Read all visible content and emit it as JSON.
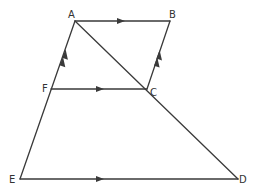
{
  "diagram": {
    "type": "geometry-figure",
    "colors": {
      "stroke": "#3a3a3a",
      "label": "#333333",
      "background": "#ffffff"
    },
    "points": {
      "A": {
        "label": "A",
        "x": 75,
        "y": 21
      },
      "B": {
        "label": "B",
        "x": 170,
        "y": 21
      },
      "C": {
        "label": "C",
        "x": 147,
        "y": 89
      },
      "D": {
        "label": "D",
        "x": 238,
        "y": 179
      },
      "E": {
        "label": "E",
        "x": 20,
        "y": 179
      },
      "F": {
        "label": "F",
        "x": 51,
        "y": 89
      }
    },
    "segments": [
      {
        "name": "AB",
        "from": "A",
        "to": "B",
        "arrows": 1
      },
      {
        "name": "FC",
        "from": "F",
        "to": "C",
        "arrows": 1
      },
      {
        "name": "ED",
        "from": "E",
        "to": "D",
        "arrows": 1
      },
      {
        "name": "EA",
        "from": "E",
        "to": "A",
        "arrows": 2
      },
      {
        "name": "CB",
        "from": "C",
        "to": "B",
        "arrows": 2
      },
      {
        "name": "AD",
        "from": "A",
        "to": "D",
        "arrows": 0
      }
    ],
    "parallel_marks": {
      "single_arrow_group": [
        "AB",
        "FC",
        "ED"
      ],
      "double_arrow_group": [
        "FA",
        "CB"
      ]
    }
  }
}
